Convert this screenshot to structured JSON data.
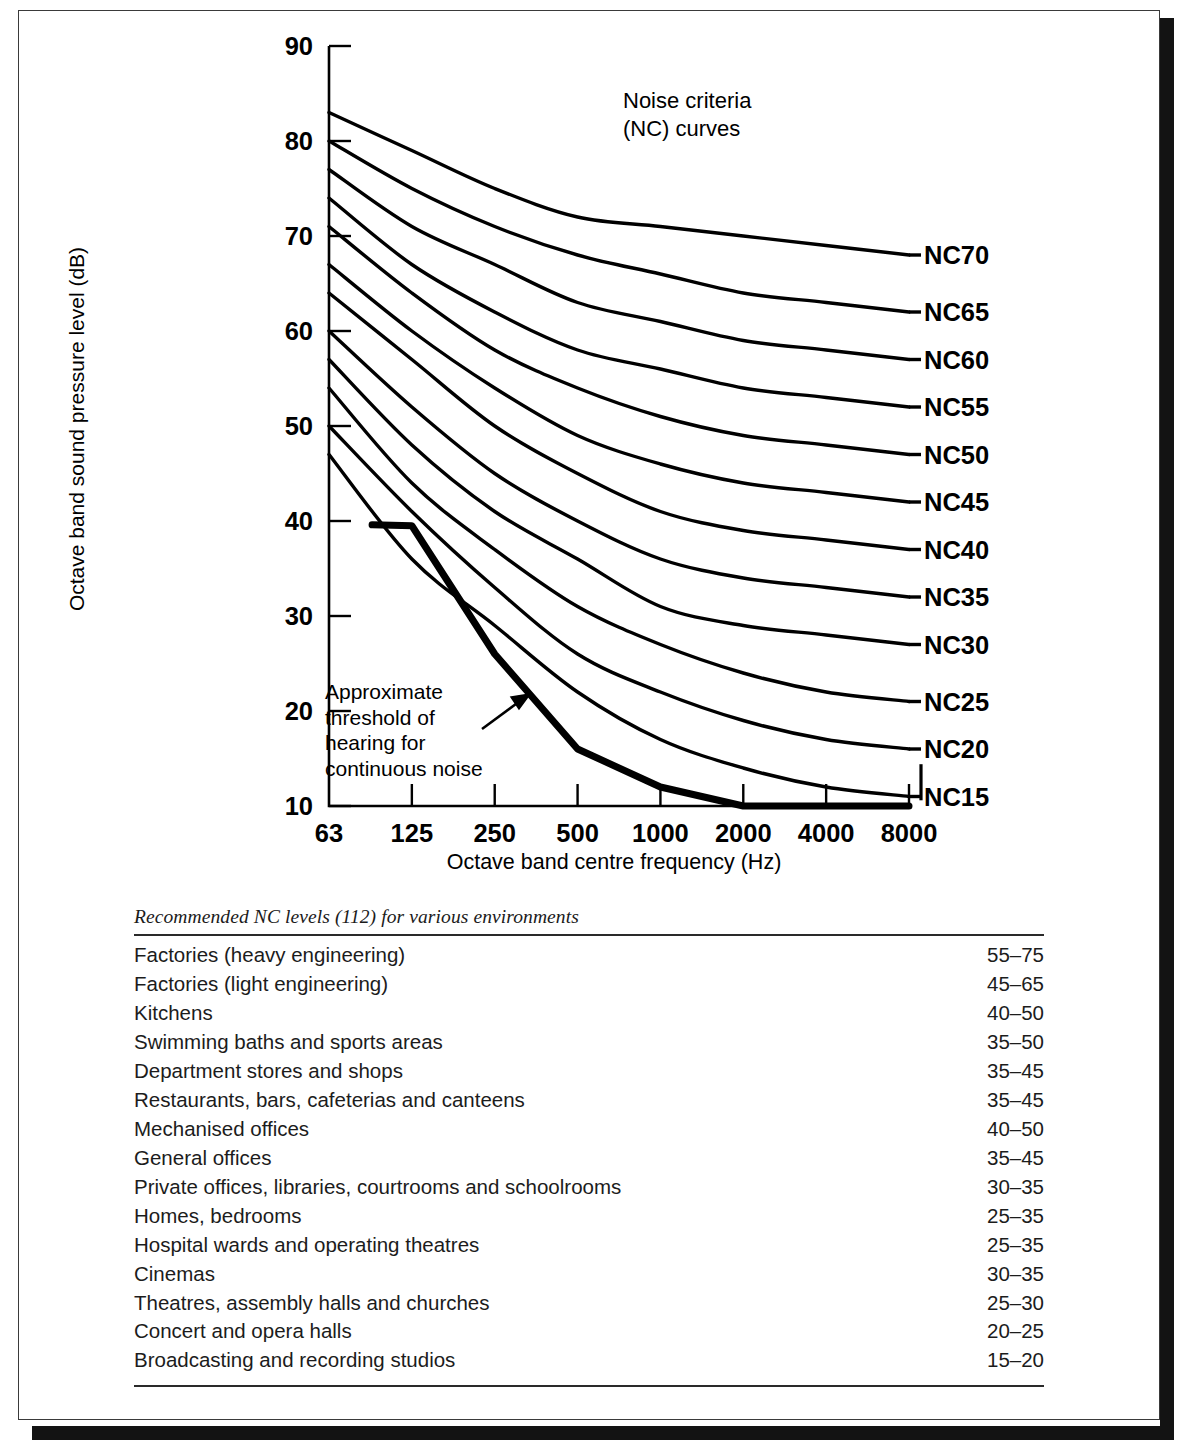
{
  "chart_data": {
    "type": "line",
    "title": "Noise criteria\n(NC) curves",
    "title_line1": "Noise criteria",
    "title_line2": "(NC) curves",
    "xlabel": "Octave band centre frequency (Hz)",
    "ylabel": "Octave band sound pressure level (dB)",
    "x": [
      63,
      125,
      250,
      500,
      1000,
      2000,
      4000,
      8000
    ],
    "xtick_labels": [
      "63",
      "125",
      "250",
      "500",
      "1000",
      "2000",
      "4000",
      "8000"
    ],
    "ytick_labels": [
      "10",
      "20",
      "30",
      "40",
      "50",
      "60",
      "70",
      "80",
      "90"
    ],
    "ylim": [
      10,
      90
    ],
    "grid": false,
    "legend_position": "right-end-labels",
    "annotation": {
      "text_line1": "Approximate",
      "text_line2": "threshold of",
      "text_line3": "hearing for",
      "text_line4": "continuous noise",
      "full_text": "Approximate threshold of hearing for continuous noise"
    },
    "series": [
      {
        "name": "NC70",
        "values": [
          83,
          79,
          75,
          72,
          71,
          70,
          69,
          68
        ]
      },
      {
        "name": "NC65",
        "values": [
          80,
          75,
          71,
          68,
          66,
          64,
          63,
          62
        ]
      },
      {
        "name": "NC60",
        "values": [
          77,
          71,
          67,
          63,
          61,
          59,
          58,
          57
        ]
      },
      {
        "name": "NC55",
        "values": [
          74,
          67,
          62,
          58,
          56,
          54,
          53,
          52
        ]
      },
      {
        "name": "NC50",
        "values": [
          71,
          64,
          58,
          54,
          51,
          49,
          48,
          47
        ]
      },
      {
        "name": "NC45",
        "values": [
          67,
          60,
          54,
          49,
          46,
          44,
          43,
          42
        ]
      },
      {
        "name": "NC40",
        "values": [
          64,
          57,
          50,
          45,
          41,
          39,
          38,
          37
        ]
      },
      {
        "name": "NC35",
        "values": [
          60,
          52,
          45,
          40,
          36,
          34,
          33,
          32
        ]
      },
      {
        "name": "NC30",
        "values": [
          57,
          48,
          41,
          36,
          31,
          29,
          28,
          27
        ]
      },
      {
        "name": "NC25",
        "values": [
          54,
          44,
          37,
          31,
          27,
          24,
          22,
          21
        ]
      },
      {
        "name": "NC20",
        "values": [
          50,
          41,
          33,
          26,
          22,
          19,
          17,
          16
        ]
      },
      {
        "name": "NC15",
        "values": [
          47,
          36,
          29,
          22,
          17,
          14,
          12,
          11
        ]
      },
      {
        "name": "Approximate threshold of hearing for continuous noise",
        "values": [
          null,
          39.5,
          26,
          16,
          12,
          10,
          10,
          10
        ],
        "emphasis": true
      }
    ]
  },
  "table": {
    "caption": "Recommended NC levels (112) for various environments",
    "rows": [
      {
        "environment": "Factories (heavy engineering)",
        "nc_level": "55–75"
      },
      {
        "environment": "Factories (light engineering)",
        "nc_level": "45–65"
      },
      {
        "environment": "Kitchens",
        "nc_level": "40–50"
      },
      {
        "environment": "Swimming baths and sports areas",
        "nc_level": "35–50"
      },
      {
        "environment": "Department stores and shops",
        "nc_level": "35–45"
      },
      {
        "environment": "Restaurants, bars, cafeterias and canteens",
        "nc_level": "35–45"
      },
      {
        "environment": "Mechanised offices",
        "nc_level": "40–50"
      },
      {
        "environment": "General offices",
        "nc_level": "35–45"
      },
      {
        "environment": "Private offices, libraries, courtrooms and schoolrooms",
        "nc_level": "30–35"
      },
      {
        "environment": "Homes, bedrooms",
        "nc_level": "25–35"
      },
      {
        "environment": "Hospital wards and operating theatres",
        "nc_level": "25–35"
      },
      {
        "environment": "Cinemas",
        "nc_level": "30–35"
      },
      {
        "environment": "Theatres, assembly halls and churches",
        "nc_level": "25–30"
      },
      {
        "environment": "Concert and opera halls",
        "nc_level": "20–25"
      },
      {
        "environment": "Broadcasting and recording studios",
        "nc_level": "15–20"
      }
    ]
  },
  "colors": {
    "ink": "#000000",
    "frame": "#3a3a3a",
    "shadow": "#131313",
    "rule": "#2a2a2a"
  }
}
